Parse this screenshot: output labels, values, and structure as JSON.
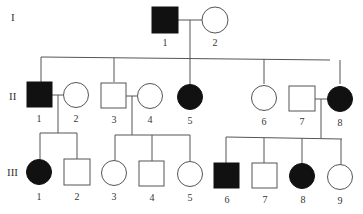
{
  "diagram": {
    "type": "pedigree",
    "generations": [
      {
        "label": "I",
        "individuals": [
          {
            "id": "1",
            "sex": "male",
            "affected": true
          },
          {
            "id": "2",
            "sex": "female",
            "affected": false
          }
        ]
      },
      {
        "label": "II",
        "individuals": [
          {
            "id": "1",
            "sex": "male",
            "affected": true
          },
          {
            "id": "2",
            "sex": "female",
            "affected": false
          },
          {
            "id": "3",
            "sex": "male",
            "affected": false
          },
          {
            "id": "4",
            "sex": "female",
            "affected": false
          },
          {
            "id": "5",
            "sex": "female",
            "affected": true
          },
          {
            "id": "6",
            "sex": "female",
            "affected": false
          },
          {
            "id": "7",
            "sex": "male",
            "affected": false
          },
          {
            "id": "8",
            "sex": "female",
            "affected": true
          }
        ]
      },
      {
        "label": "III",
        "individuals": [
          {
            "id": "1",
            "sex": "female",
            "affected": true
          },
          {
            "id": "2",
            "sex": "male",
            "affected": false
          },
          {
            "id": "3",
            "sex": "female",
            "affected": false
          },
          {
            "id": "4",
            "sex": "male",
            "affected": false
          },
          {
            "id": "5",
            "sex": "female",
            "affected": false
          },
          {
            "id": "6",
            "sex": "male",
            "affected": true
          },
          {
            "id": "7",
            "sex": "male",
            "affected": false
          },
          {
            "id": "8",
            "sex": "female",
            "affected": true
          },
          {
            "id": "9",
            "sex": "female",
            "affected": false
          }
        ]
      }
    ],
    "unions": [
      {
        "partners": [
          "I-1",
          "I-2"
        ],
        "children": [
          "II-1",
          "II-3",
          "II-5",
          "II-6",
          "II-8"
        ]
      },
      {
        "partners": [
          "II-1",
          "II-2"
        ],
        "children": [
          "III-1",
          "III-2"
        ]
      },
      {
        "partners": [
          "II-3",
          "II-4"
        ],
        "children": [
          "III-3",
          "III-4",
          "III-5"
        ]
      },
      {
        "partners": [
          "II-7",
          "II-8"
        ],
        "children": [
          "III-6",
          "III-7",
          "III-8",
          "III-9"
        ]
      }
    ]
  },
  "labels": {
    "gen_I": "I",
    "gen_II": "II",
    "gen_III": "III",
    "I_1": "1",
    "I_2": "2",
    "II_1": "1",
    "II_2": "2",
    "II_3": "3",
    "II_4": "4",
    "II_5": "5",
    "II_6": "6",
    "II_7": "7",
    "II_8": "8",
    "III_1": "1",
    "III_2": "2",
    "III_3": "3",
    "III_4": "4",
    "III_5": "5",
    "III_6": "6",
    "III_7": "7",
    "III_8": "8",
    "III_9": "9"
  },
  "colors": {
    "affected": "#111111",
    "unaffected": "#ffffff",
    "line": "#555555"
  }
}
